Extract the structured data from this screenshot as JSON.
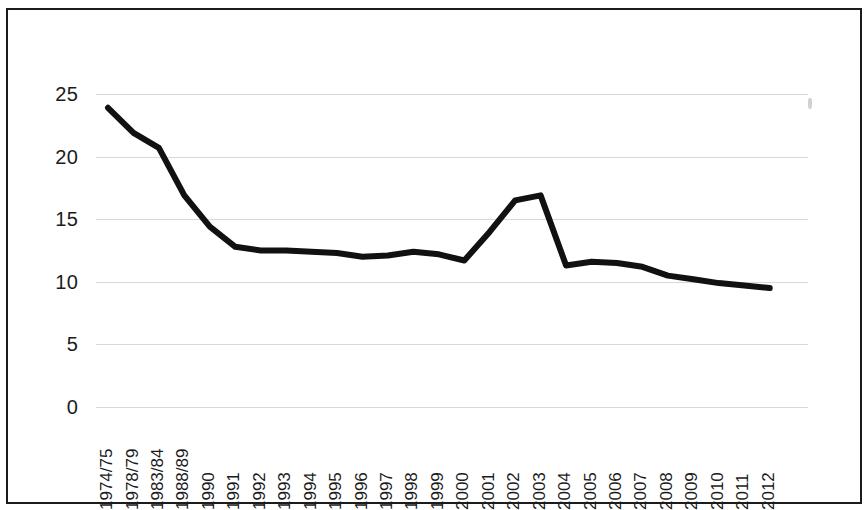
{
  "chart_data": {
    "type": "line",
    "title": "",
    "subtitle": "",
    "xlabel": "",
    "ylabel": "",
    "grid": true,
    "legend": false,
    "legend_position": "none",
    "line_color": "#111111",
    "line_width": 6,
    "ylim": [
      0,
      27
    ],
    "yticks": [
      0,
      5,
      10,
      15,
      20,
      25
    ],
    "ytick_labels": [
      "0",
      "5",
      "10",
      "15",
      "20",
      "25"
    ],
    "categories": [
      "1974/75",
      "1978/79",
      "1983/84",
      "1988/89",
      "1990",
      "1991",
      "1992",
      "1993",
      "1994",
      "1995",
      "1996",
      "1997",
      "1998",
      "1999",
      "2000",
      "2001",
      "2002",
      "2003",
      "2004",
      "2005",
      "2006",
      "2007",
      "2008",
      "2009",
      "2010",
      "2011",
      "2012"
    ],
    "values": [
      23.9,
      21.9,
      20.7,
      16.9,
      14.4,
      12.8,
      12.5,
      12.5,
      12.4,
      12.3,
      12.0,
      12.1,
      12.4,
      12.2,
      11.7,
      14.0,
      16.5,
      16.9,
      11.3,
      11.6,
      11.5,
      11.2,
      10.5,
      10.2,
      9.9,
      9.7,
      9.5
    ]
  },
  "figure": {
    "border_color": "#1b1b1b",
    "background": "#ffffff",
    "gridline_color": "#d8d8d8"
  }
}
